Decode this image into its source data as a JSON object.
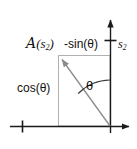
{
  "figure": {
    "width": 137,
    "height": 149,
    "background": "#ffffff"
  },
  "colors": {
    "axis": "#1a1a1a",
    "vector": "#8c8c8c",
    "rectangle": "#b0b0b0",
    "arc": "#3a3a3a",
    "text": "#111111"
  },
  "labels": {
    "operator": {
      "symbol": "A",
      "open_paren": "(",
      "argument": "s",
      "subscript": "2",
      "close_paren": ")",
      "full": "A(s2)"
    },
    "sine_component": "-sin(θ)",
    "cosine_component": "cos(θ)",
    "axis_vertical": {
      "symbol": "s",
      "subscript": "2"
    },
    "angle": "θ"
  },
  "geometry": {
    "origin": {
      "x": 110,
      "y": 126
    },
    "vector_tip": {
      "x": 58,
      "y": 55
    },
    "x_axis": {
      "x1": 10,
      "y1": 126,
      "x2": 133,
      "y2": 126
    },
    "y_axis": {
      "x1": 110,
      "y1": 126,
      "x2": 110,
      "y2": 16
    },
    "x_axis_tick": {
      "x": 22,
      "y": 126
    },
    "y_axis_tick": {
      "x": 110,
      "y": 40
    },
    "rectangle": {
      "left": 58,
      "top": 55,
      "right": 110,
      "bottom": 126
    },
    "arc_radius": 46
  },
  "annotations": {
    "arrowheads": [
      "x-axis-right",
      "y-axis-top",
      "vector-tip"
    ],
    "ticks": [
      "x-axis-negative-tick",
      "y-axis-unit-tick"
    ]
  }
}
